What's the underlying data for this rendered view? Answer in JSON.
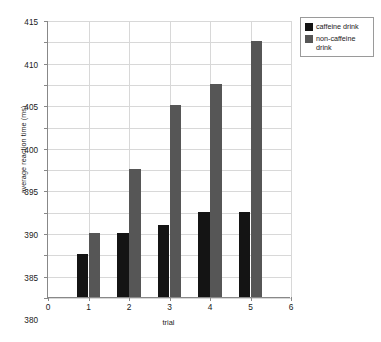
{
  "chart_data": {
    "type": "bar",
    "title": "",
    "subtitle": "",
    "xlabel": "trial",
    "ylabel": "average reaction time (ms)",
    "categories": [
      "1",
      "2",
      "3",
      "4",
      "5"
    ],
    "xlim": [
      0,
      6
    ],
    "ylim": [
      350,
      415
    ],
    "ytick_step": 5,
    "xtick_step": 1,
    "grid": "both",
    "legend_position": "top-right",
    "series": [
      {
        "name": "caffeine drink",
        "color": "#141414",
        "values": [
          360,
          365,
          367,
          370,
          370
        ]
      },
      {
        "name": "non-caffeine drink",
        "color": "#565656",
        "values": [
          365,
          380,
          395,
          400,
          410
        ]
      }
    ],
    "ytick_labels": [
      "350",
      "355",
      "360",
      "365",
      "370",
      "375",
      "380",
      "385",
      "390",
      "395",
      "400",
      "405",
      "410",
      "415"
    ],
    "xtick_labels": [
      "0",
      "1",
      "2",
      "3",
      "4",
      "5",
      "6"
    ],
    "annotations": []
  },
  "legend": {
    "entries": [
      {
        "label": "caffeine drink"
      },
      {
        "label": "non-caffeine drink"
      }
    ]
  },
  "axes": {
    "x_title": "trial",
    "y_title": "average reaction time (ms)"
  }
}
